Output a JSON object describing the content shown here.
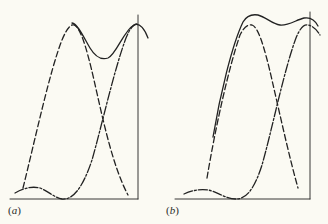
{
  "figure": {
    "panels": [
      {
        "id": "a",
        "label_open": "(",
        "label_letter": "a",
        "label_close": ")"
      },
      {
        "id": "b",
        "label_open": "(",
        "label_letter": "b",
        "label_close": ")"
      }
    ],
    "line_color": "#222222",
    "background": "#fbfaf3",
    "curves": [
      {
        "name": "component-1",
        "style": "dashed"
      },
      {
        "name": "component-2",
        "style": "dash-dot"
      },
      {
        "name": "sum",
        "style": "solid"
      }
    ]
  }
}
